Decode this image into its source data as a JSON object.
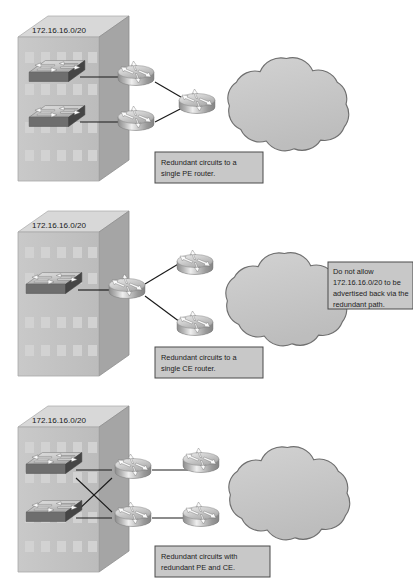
{
  "figure": {
    "type": "network-topology-diagram",
    "background_color": "#ffffff",
    "line_color": "#1a1a1a"
  },
  "panels": [
    {
      "id": "panel-single-pe",
      "ip_label": "172.16.16.0/20",
      "caption_line_1": "Redundant circuits to a",
      "caption_line_2": "single PE router.",
      "devices": {
        "switches": 2,
        "ce_routers": 2,
        "pe_routers": 1,
        "cloud": 1
      }
    },
    {
      "id": "panel-single-ce",
      "ip_label": "172.16.16.0/20",
      "caption_line_1": "Redundant circuits to a",
      "caption_line_2": "single CE router.",
      "devices": {
        "switches": 1,
        "ce_routers": 1,
        "pe_routers": 2,
        "cloud": 1
      }
    },
    {
      "id": "panel-redundant-pe-ce",
      "ip_label": "172.16.16.0/20",
      "caption_line_1": "Redundant circuits with",
      "caption_line_2": "redundant PE and CE.",
      "devices": {
        "switches": 2,
        "ce_routers": 2,
        "pe_routers": 2,
        "cloud": 1
      }
    }
  ],
  "side_note": {
    "line_1": "Do not allow",
    "line_2": "172.16.16.0/20 to be",
    "line_3": "advertised back via the",
    "line_4": "redundant path."
  },
  "colors": {
    "building_front": "#c3c3c3",
    "building_side": "#a9a9a9",
    "building_roof": "#d3d3d3",
    "building_window": "#cfcfcf",
    "cloud_fill": "#c9c9c9",
    "cloud_stroke": "#6f6f6f",
    "router_top": "#d8d8d8",
    "router_body": "#a8a8a8",
    "switch_top": "#d5d5d5",
    "switch_front": "#6e6e6e",
    "switch_side": "#4a4a4a",
    "caption_box_fill": "#c8c8c8",
    "caption_box_stroke": "#4a4a4a"
  }
}
